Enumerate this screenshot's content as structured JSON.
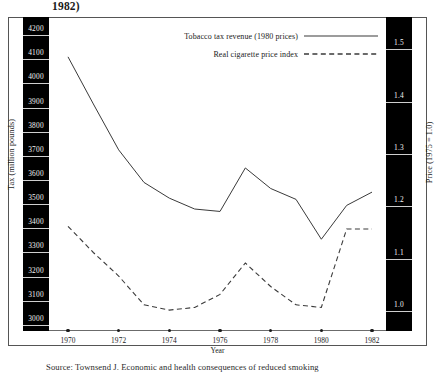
{
  "title_fragment": "1982)",
  "source_note": "Source: Townsend J. Economic and health consequences of reduced smoking",
  "axes": {
    "left_title": "Tax (million pounds)",
    "right_title": "Price (1975 = 1.0)",
    "x_title": "Year",
    "left_ticks": [
      "4200",
      "4100",
      "4000",
      "3900",
      "3800",
      "3700",
      "3600",
      "3500",
      "3400",
      "3300",
      "3200",
      "3100",
      "3000"
    ],
    "right_ticks": [
      "1.5",
      "1.4",
      "1.3",
      "1.2",
      "1.1",
      "1.0"
    ],
    "x_ticks": [
      "1970",
      "1972",
      "1974",
      "1976",
      "1978",
      "1980",
      "1982"
    ]
  },
  "legend": {
    "items": [
      {
        "label": "Tobacco tax revenue (1980 prices)",
        "style": "solid"
      },
      {
        "label": "Real cigarette price index",
        "style": "dashed"
      }
    ]
  },
  "chart_data": {
    "type": "line",
    "xlabel": "Year",
    "ylabel": "Tax (million pounds)",
    "y2label": "Price (1975 = 1.0)",
    "xlim": [
      1969.5,
      1982.5
    ],
    "ylim": [
      2950,
      4250
    ],
    "y2lim": [
      0.95,
      1.55
    ],
    "grid": false,
    "legend_position": "top-center",
    "x": [
      1970,
      1971,
      1972,
      1973,
      1974,
      1975,
      1976,
      1977,
      1978,
      1979,
      1980,
      1981,
      1982
    ],
    "series": [
      {
        "name": "Tobacco tax revenue (1980 prices)",
        "axis": "left",
        "units": "million pounds",
        "style": "solid",
        "color": "#3a3a3a",
        "values": [
          4085,
          3890,
          3700,
          3565,
          3500,
          3455,
          3445,
          3625,
          3540,
          3495,
          3330,
          3470,
          3525
        ]
      },
      {
        "name": "Real cigarette price index",
        "axis": "right",
        "units": "index, 1975 = 1.0",
        "style": "dashed",
        "color": "#3a3a3a",
        "values": [
          1.15,
          1.1,
          1.055,
          1.0,
          0.99,
          0.995,
          1.02,
          1.08,
          1.035,
          1.0,
          0.995,
          1.145,
          1.145
        ]
      }
    ]
  }
}
